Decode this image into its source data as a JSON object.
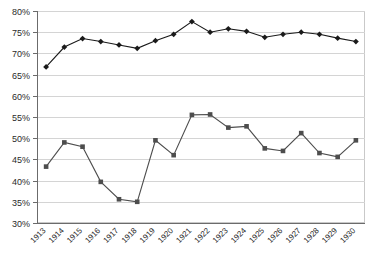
{
  "chart_data": {
    "type": "line",
    "title": "",
    "subtitle": "",
    "xlabel": "",
    "ylabel": "",
    "categories": [
      "1913",
      "1914",
      "1915",
      "1916",
      "1917",
      "1918",
      "1919",
      "1920",
      "1921",
      "1922",
      "1923",
      "1924",
      "1925",
      "1926",
      "1927",
      "1928",
      "1929",
      "1930"
    ],
    "ylim": [
      30,
      80
    ],
    "ytick_labels": [
      "30%",
      "35%",
      "40%",
      "45%",
      "50%",
      "55%",
      "60%",
      "65%",
      "70%",
      "75%",
      "80%"
    ],
    "ytick_values": [
      30,
      35,
      40,
      45,
      50,
      55,
      60,
      65,
      70,
      75,
      80
    ],
    "ytick_step": 5,
    "grid": true,
    "grid_axis": "y",
    "legend": false,
    "legend_position": "none",
    "series": [
      {
        "name": "Upper series",
        "marker": "diamond",
        "color": "#1a1a1a",
        "values": [
          66.8,
          71.5,
          73.5,
          72.8,
          72.0,
          71.2,
          73.0,
          74.5,
          77.5,
          75.0,
          75.8,
          75.2,
          73.8,
          74.5,
          75.0,
          74.5,
          73.6,
          72.8
        ]
      },
      {
        "name": "Lower series",
        "marker": "square",
        "color": "#4d4d4d",
        "values": [
          43.3,
          49.0,
          48.0,
          39.7,
          35.6,
          35.0,
          49.5,
          46.0,
          55.5,
          55.6,
          52.5,
          52.8,
          47.6,
          47.0,
          51.2,
          46.5,
          45.6,
          49.5
        ]
      }
    ]
  },
  "colors": {
    "grid": "#d4d4d4",
    "axis": "#6b6b6b",
    "plot_border": "#c9c9c9",
    "background": "#ffffff",
    "series_1": "#1a1a1a",
    "series_2": "#4d4d4d"
  }
}
